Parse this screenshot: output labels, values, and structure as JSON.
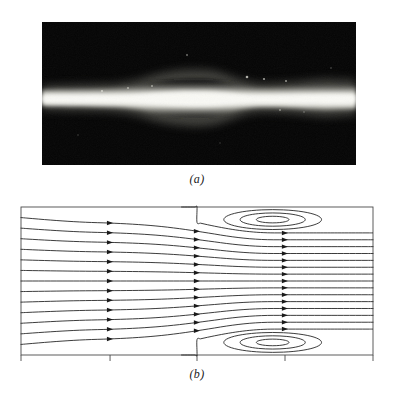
{
  "figure": {
    "type": "two-panel-scientific-figure",
    "background_color": "#ffffff",
    "width": 394,
    "height": 398
  },
  "panel_a": {
    "caption": "(a)",
    "kind": "photograph",
    "description": "flow-visualization-photograph",
    "frame": {
      "x": 42,
      "y": 22,
      "width": 314,
      "height": 143
    },
    "background_color": "#050505",
    "jet_color": "#f2f2ee",
    "jet_centerline_y": 0.53,
    "jet_half_width_profile": [
      {
        "x": 0.0,
        "half_width": 0.055
      },
      {
        "x": 0.06,
        "half_width": 0.058
      },
      {
        "x": 0.12,
        "half_width": 0.06
      },
      {
        "x": 0.18,
        "half_width": 0.062
      },
      {
        "x": 0.24,
        "half_width": 0.066
      },
      {
        "x": 0.3,
        "half_width": 0.08
      },
      {
        "x": 0.36,
        "half_width": 0.105
      },
      {
        "x": 0.42,
        "half_width": 0.122
      },
      {
        "x": 0.48,
        "half_width": 0.128
      },
      {
        "x": 0.54,
        "half_width": 0.124
      },
      {
        "x": 0.6,
        "half_width": 0.1
      },
      {
        "x": 0.64,
        "half_width": 0.08
      },
      {
        "x": 0.68,
        "half_width": 0.068
      },
      {
        "x": 0.72,
        "half_width": 0.066
      },
      {
        "x": 0.78,
        "half_width": 0.07
      },
      {
        "x": 0.84,
        "half_width": 0.078
      },
      {
        "x": 0.9,
        "half_width": 0.085
      },
      {
        "x": 0.95,
        "half_width": 0.082
      },
      {
        "x": 1.0,
        "half_width": 0.078
      }
    ]
  },
  "panel_b": {
    "caption": "(b)",
    "kind": "streamline-plot",
    "description": "computed-streamline-pattern-with-two-recirculation-vortices",
    "frame": {
      "x": 21,
      "y": 207,
      "width": 352,
      "height": 148
    },
    "line_color": "#1a1a1a",
    "frame_color": "#4a4a4a",
    "axis_ticks": {
      "bottom": [
        0.0,
        0.253,
        0.5,
        0.75,
        1.0
      ],
      "tick_length": 6
    },
    "streamline_count": 13,
    "arrow_columns": [
      0.253,
      0.5,
      0.75
    ],
    "vortices": [
      {
        "name": "upper-vortex",
        "wall": "top",
        "center_x": 0.715,
        "center_y": 0.085,
        "separation_x": 0.5,
        "reattachment_x": 1.0,
        "closed_contour_count": 3
      },
      {
        "name": "lower-vortex",
        "wall": "bottom",
        "center_x": 0.715,
        "center_y": 0.915,
        "separation_x": 0.5,
        "reattachment_x": 1.0,
        "closed_contour_count": 3
      }
    ]
  }
}
